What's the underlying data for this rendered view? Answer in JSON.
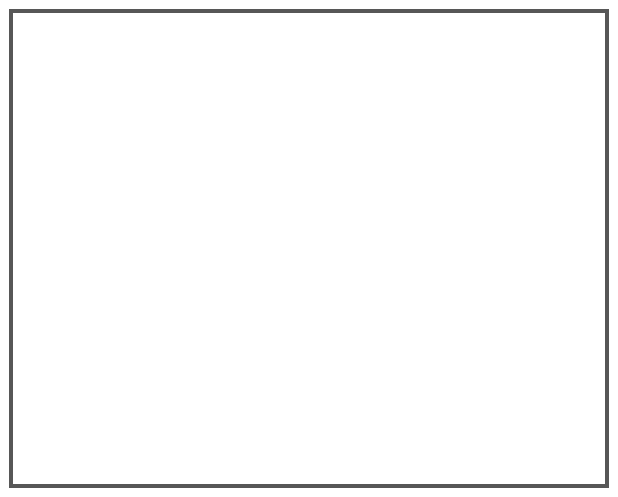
{
  "map": {
    "title": "Day 2",
    "kind": "surface-weather-forecast-map",
    "region": "United States"
  },
  "labels": {
    "day": "Day 2",
    "high_north": "H",
    "high_east": "H",
    "high_west": "H",
    "low_plains": "L"
  },
  "pressure_centers": [
    {
      "type": "high",
      "symbol": "H",
      "location": "northern-plains",
      "x": 311,
      "y": 96
    },
    {
      "type": "high",
      "symbol": "H",
      "location": "northeast",
      "x": 532,
      "y": 115
    },
    {
      "type": "high",
      "symbol": "H",
      "location": "great-basin",
      "x": 187,
      "y": 238
    },
    {
      "type": "low",
      "symbol": "L",
      "location": "central-plains",
      "x": 277,
      "y": 253
    }
  ],
  "fronts": [
    {
      "name": "pacific-northwest-cold-front",
      "type": "cold",
      "barbs": 2
    },
    {
      "name": "main-cold-front",
      "type": "cold",
      "barbs": 5
    },
    {
      "name": "great-lakes-cold-front",
      "type": "cold",
      "barbs": 4
    },
    {
      "name": "gulf-warm-front",
      "type": "warm",
      "bumps": 4
    },
    {
      "name": "ohio-valley-warm-front",
      "type": "warm",
      "bumps": 2
    }
  ],
  "weather_symbols": {
    "snow": {
      "icon": "snowflake-icon",
      "count": 5,
      "region": "Idaho / western Montana"
    },
    "rain": {
      "icon": "raindrop-icon",
      "count": 6,
      "region": "Tennessee Valley / Southeast"
    }
  },
  "colors": {
    "frame": "#575757",
    "front_line": "#5e5e5e",
    "warm_front_line": "#3a3a3a",
    "symbol": "#5a5a5a",
    "label": "#0a0a0a",
    "water": "#ffffff",
    "state_border": "#ffffff",
    "coast_line": "#4a4a4a",
    "band_1": "#e8e8e8",
    "band_2": "#dcdcdc",
    "band_3": "#d0d0d0",
    "band_4": "#c4c4c4",
    "band_5": "#b8b8b8",
    "band_6": "#ababab",
    "band_7": "#9e9e9e",
    "band_8": "#949494"
  }
}
